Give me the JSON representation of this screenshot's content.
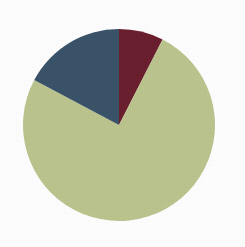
{
  "figure": {
    "background_color": "#ffffff",
    "width": 245,
    "height": 247,
    "title": ""
  },
  "geometry": {
    "center_x": 119,
    "center_y": 125,
    "radius": 96,
    "start_angle_deg": 0,
    "direction": "clockwise"
  },
  "chart_data": {
    "type": "pie",
    "title": "",
    "xlabel": "",
    "ylabel": "",
    "legend": "none",
    "grid": false,
    "start_angle_deg": 90,
    "counterclock": false,
    "categories": [
      "Segment 1",
      "Segment 2",
      "Segment 3"
    ],
    "values": [
      7.5,
      75.0,
      17.5
    ],
    "colors": [
      "#6b1f2e",
      "#bcc58e",
      "#3a5369"
    ],
    "slices": [
      {
        "label": "Segment 1",
        "value": 7.5,
        "percent": "7.5%",
        "color": "#6b1f2e",
        "color_name": "dark-maroon",
        "start_deg": 0,
        "end_deg": 27
      },
      {
        "label": "Segment 2",
        "value": 75.0,
        "percent": "75%",
        "color": "#bcc58e",
        "color_name": "sage-green",
        "start_deg": 27,
        "end_deg": 298
      },
      {
        "label": "Segment 3",
        "value": 17.5,
        "percent": "17.5%",
        "color": "#3a5369",
        "color_name": "slate-blue",
        "start_deg": 298,
        "end_deg": 360
      }
    ]
  }
}
